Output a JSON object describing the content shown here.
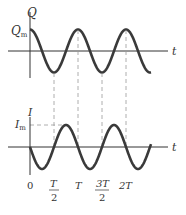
{
  "figure": {
    "top_graph": {
      "y_axis_label": "Q",
      "amplitude_label": "Q",
      "amplitude_sub": "m",
      "x_axis_label": "t",
      "function": "Q_m cos(2πt/T)"
    },
    "bottom_graph": {
      "y_axis_label": "I",
      "amplitude_label": "I",
      "amplitude_sub": "m",
      "x_axis_label": "t",
      "function": "-I_m sin(2πt/T)"
    },
    "tick_labels": {
      "zero": "0",
      "half_T_num": "T",
      "half_T_den": "2",
      "T": "T",
      "three_half_T_num": "3T",
      "three_half_T_den": "2",
      "two_T": "2T"
    },
    "colors": {
      "curve": "#3a3a3a",
      "axis": "#333333",
      "dashed": "#999999"
    }
  }
}
